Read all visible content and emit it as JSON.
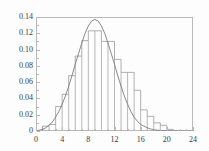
{
  "figure": {
    "background_color": "#fdfdfd",
    "axis_color": "#b9b9b9",
    "text_color": "#3a3a3a",
    "bar_color": "#9a9a9a",
    "curve_color": "#7d7d7d"
  },
  "chart_data": {
    "type": "bar",
    "title": "",
    "subtitle": "",
    "xlabel": "",
    "ylabel": "",
    "xlim": [
      0,
      24
    ],
    "ylim": [
      0,
      0.14
    ],
    "grid": false,
    "legend": null,
    "x_ticks": [
      0,
      4,
      8,
      12,
      16,
      20,
      24
    ],
    "x_tick_labels": [
      "0",
      "4",
      "8",
      "12",
      "16",
      "20",
      "24"
    ],
    "x_minor_tick_step": 1,
    "y_ticks": [
      0,
      0.02,
      0.04,
      0.06,
      0.08,
      0.1,
      0.12,
      0.14
    ],
    "y_tick_labels": [
      "0",
      "0.02",
      "0.04",
      "0.06",
      "0.08",
      "0.10",
      "0.12",
      "0.14"
    ],
    "bin_width": 1,
    "categories": [
      "1-2",
      "2-3",
      "3-4",
      "4-5",
      "5-6",
      "6-7",
      "7-8",
      "8-9",
      "9-10",
      "10-11",
      "11-12",
      "12-13",
      "13-14",
      "14-15",
      "15-16",
      "16-17",
      "17-18",
      "18-19",
      "19-20",
      "20-21"
    ],
    "bin_edges": [
      1,
      2,
      3,
      4,
      5,
      6,
      7,
      8,
      9,
      10,
      11,
      12,
      13,
      14,
      15,
      16,
      17,
      18,
      19,
      20,
      21
    ],
    "values": [
      0.006,
      0.008,
      0.03,
      0.045,
      0.068,
      0.092,
      0.111,
      0.123,
      0.123,
      0.11,
      0.11,
      0.088,
      0.072,
      0.072,
      0.05,
      0.026,
      0.018,
      0.01,
      0.007,
      0.002
    ],
    "series": [
      {
        "name": "histogram",
        "type": "bar",
        "values": [
          0.006,
          0.008,
          0.03,
          0.045,
          0.068,
          0.092,
          0.111,
          0.123,
          0.123,
          0.11,
          0.11,
          0.088,
          0.072,
          0.072,
          0.05,
          0.026,
          0.018,
          0.01,
          0.007,
          0.002
        ]
      },
      {
        "name": "fitted-density-curve",
        "type": "line",
        "x": [
          0,
          0.5,
          1,
          1.5,
          2,
          2.5,
          3,
          3.5,
          4,
          4.5,
          5,
          5.5,
          6,
          6.5,
          7,
          7.5,
          8,
          8.5,
          9,
          9.5,
          10,
          10.5,
          11,
          11.5,
          12,
          12.5,
          13,
          13.5,
          14,
          14.5,
          15,
          15.5,
          16,
          16.5,
          17,
          17.5,
          18,
          18.5,
          19,
          19.5,
          20,
          21,
          22,
          23,
          24
        ],
        "y": [
          0.0,
          0.001,
          0.002,
          0.004,
          0.007,
          0.011,
          0.017,
          0.024,
          0.033,
          0.043,
          0.055,
          0.068,
          0.082,
          0.095,
          0.108,
          0.12,
          0.129,
          0.135,
          0.137,
          0.135,
          0.129,
          0.12,
          0.108,
          0.095,
          0.082,
          0.068,
          0.055,
          0.043,
          0.033,
          0.024,
          0.017,
          0.012,
          0.008,
          0.006,
          0.004,
          0.0025,
          0.0016,
          0.001,
          0.0006,
          0.0004,
          0.0002,
          0.0001,
          0.0,
          0.0,
          0.0
        ]
      }
    ]
  }
}
